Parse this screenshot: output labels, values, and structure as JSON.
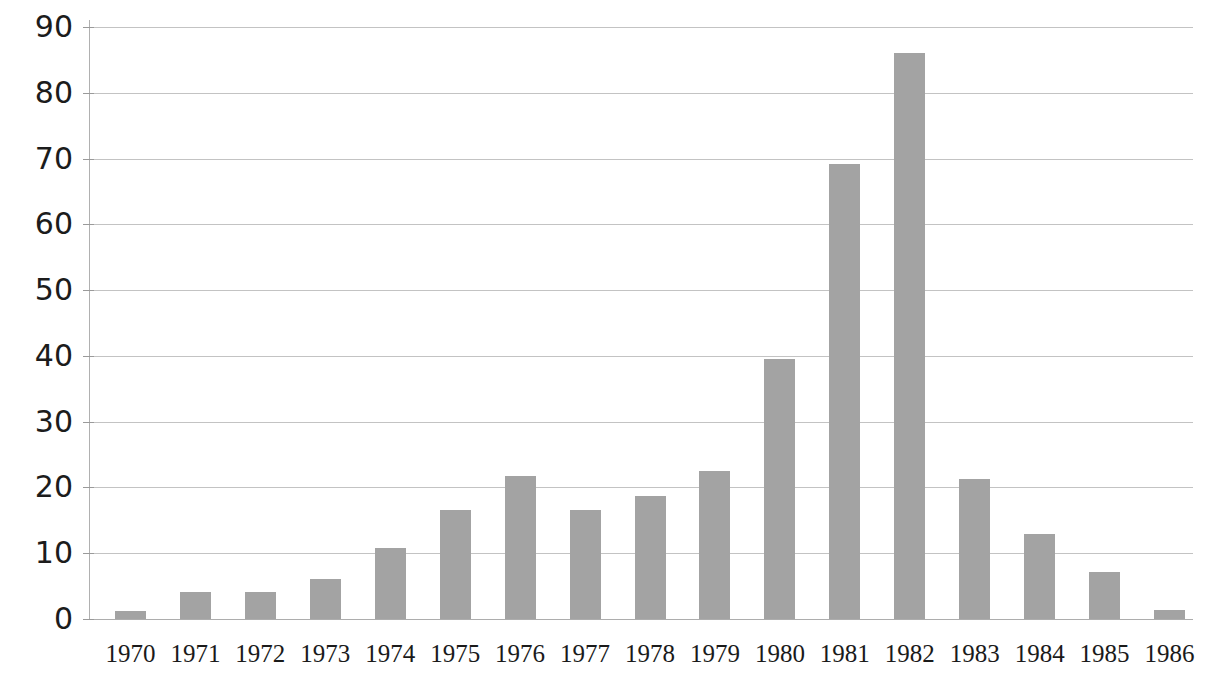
{
  "chart_data": {
    "type": "bar",
    "title": "",
    "subtitle": "",
    "xlabel": "",
    "ylabel": "",
    "categories": [
      "1970",
      "1971",
      "1972",
      "1973",
      "1974",
      "1975",
      "1976",
      "1977",
      "1978",
      "1979",
      "1980",
      "1981",
      "1982",
      "1983",
      "1984",
      "1985",
      "1986"
    ],
    "values": [
      1.2,
      4.1,
      4.1,
      6.1,
      10.8,
      16.6,
      21.7,
      16.6,
      18.7,
      22.5,
      39.5,
      69.2,
      86.0,
      21.3,
      13.0,
      7.1,
      1.3
    ],
    "series": [
      {
        "name": "",
        "values": [
          1.2,
          4.1,
          4.1,
          6.1,
          10.8,
          16.6,
          21.7,
          16.6,
          18.7,
          22.5,
          39.5,
          69.2,
          86.0,
          21.3,
          13.0,
          7.1,
          1.3
        ]
      }
    ],
    "ylim": [
      0,
      90
    ],
    "y_ticks": [
      0,
      10,
      20,
      30,
      40,
      50,
      60,
      70,
      80,
      90
    ],
    "y_tick_labels": [
      "0",
      "10",
      "20",
      "30",
      "40",
      "50",
      "60",
      "70",
      "80",
      "90"
    ],
    "grid": true,
    "grid_axis": "y",
    "legend": false,
    "legend_position": "none",
    "bar_color": "#a3a3a3",
    "gridline_color": "#b9b9b9",
    "axis_color": "#b0b0b0",
    "text_color": "#1c1c1c",
    "background_color": "#ffffff",
    "annotations": []
  }
}
